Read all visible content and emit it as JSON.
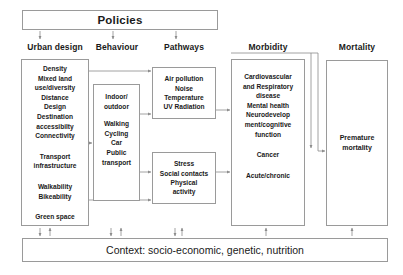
{
  "figure": {
    "type": "conceptual-framework-diagram",
    "title_box": "Policies",
    "context_box": "Context: socio-economic, genetic, nutrition"
  },
  "columns": {
    "headers": [
      {
        "id": "urban-design",
        "label": "Urban design"
      },
      {
        "id": "behaviour",
        "label": "Behaviour"
      },
      {
        "id": "pathways",
        "label": "Pathways"
      },
      {
        "id": "morbidity",
        "label": "Morbidity"
      },
      {
        "id": "mortality",
        "label": "Mortality"
      }
    ]
  },
  "urban_design": {
    "group1": "Density\nMixed land\nuse/diversity\nDistance\nDesign\nDestination\naccessibilty\nConnectivity",
    "group2": "Transport\ninfrastructure",
    "group3": "Walkability\nBikeability",
    "group4": "Green space"
  },
  "behaviour": {
    "group1": "Indoor/\noutdoor",
    "group2": "Walking\nCycling\nCar\nPublic\ntransport"
  },
  "pathways": {
    "environmental": "Air pollution\nNoise\nTemperature\nUV Radiation",
    "psychosocial": "Stress\nSocial contacts\nPhysical\nactivity"
  },
  "morbidity": {
    "group1": "Cardiovascular\nand Respiratory\ndisease\nMental health\nNeurodevelop\nment/cognitive\nfunction",
    "group2": "Cancer",
    "group3": "Acute/chronic"
  },
  "mortality": {
    "group1": "Premature\nmortality"
  },
  "connectors": {
    "policies_down_arrows": [
      "urban-design",
      "behaviour",
      "pathways"
    ],
    "context_arrows": [
      {
        "column": "urban-design",
        "direction": "bidirectional"
      },
      {
        "column": "behaviour",
        "direction": "bidirectional"
      },
      {
        "column": "pathways",
        "direction": "bidirectional"
      },
      {
        "column": "morbidity",
        "direction": "up"
      },
      {
        "column": "mortality",
        "direction": "up"
      }
    ]
  },
  "colors": {
    "border": "#9a9a9a",
    "text": "#1a1a1a",
    "background": "#ffffff",
    "connector": "#8c8c8c"
  }
}
